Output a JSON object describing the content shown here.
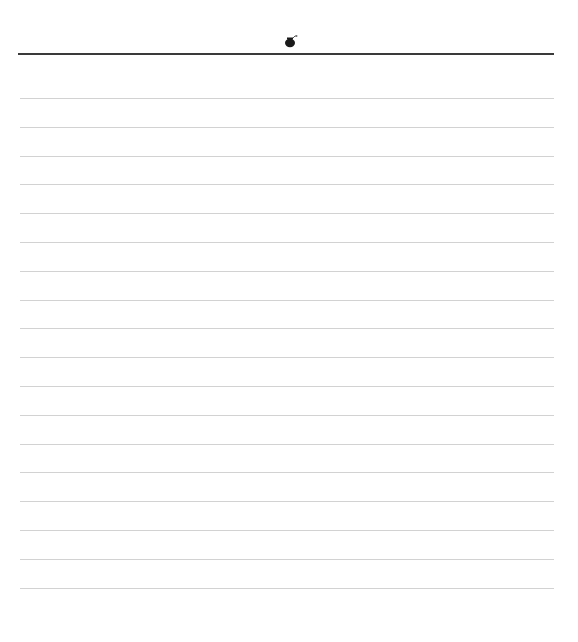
{
  "page": {
    "type": "lined-paper",
    "header_icon": "bomb-icon",
    "line_count": 18,
    "line_spacing_px": 28.8,
    "colors": {
      "background": "#ffffff",
      "header_rule": "#3a3a3a",
      "line": "#d2d2d2"
    }
  }
}
